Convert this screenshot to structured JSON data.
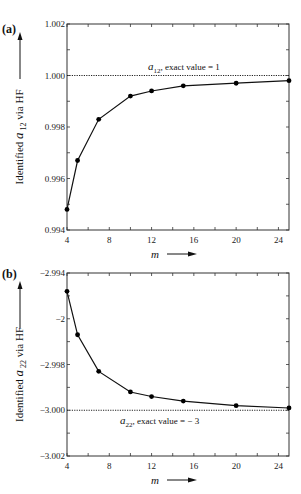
{
  "chart_data": [
    {
      "type": "line",
      "panel": "(a)",
      "title": "",
      "xlabel": "m",
      "ylabel": "Identified a12 via HF",
      "ylabel_main": "Identified ",
      "ylabel_sym": "a",
      "ylabel_sub": "12",
      "ylabel_tail": " via HF",
      "xlim": [
        4,
        25
      ],
      "ylim": [
        0.994,
        1.002
      ],
      "xticks": [
        4,
        8,
        12,
        16,
        20,
        24
      ],
      "yticks": [
        "0.994",
        "0.996",
        "0.998",
        "1.000",
        "1.002"
      ],
      "reference_line": {
        "value": 1.0,
        "style": "dotted"
      },
      "annotation": {
        "sym": "a",
        "sub": "12",
        "text": ", exact value = 1"
      },
      "x": [
        4,
        5,
        7,
        10,
        12,
        15,
        20,
        25
      ],
      "values": [
        0.9948,
        0.9967,
        0.9983,
        0.9992,
        0.9994,
        0.9996,
        0.9997,
        0.9998
      ],
      "grid": false
    },
    {
      "type": "line",
      "panel": "(b)",
      "title": "",
      "xlabel": "m",
      "ylabel": "Identified a22 via HF",
      "ylabel_main": "Identified ",
      "ylabel_sym": "a",
      "ylabel_sub": "22",
      "ylabel_tail": " via HF",
      "xlim": [
        4,
        25
      ],
      "ylim": [
        -3.002,
        -2.994
      ],
      "xticks": [
        4,
        8,
        12,
        16,
        20,
        24
      ],
      "yticks": [
        "-3.002",
        "-3.000",
        "-2.998",
        "-2",
        "-2.994"
      ],
      "reference_line": {
        "value": -3.0,
        "style": "dotted"
      },
      "annotation": {
        "sym": "a",
        "sub": "22",
        "text": ", exact value = − 3"
      },
      "x": [
        4,
        5,
        7,
        10,
        12,
        15,
        20,
        25
      ],
      "values": [
        -2.9948,
        -2.9967,
        -2.9983,
        -2.9992,
        -2.9994,
        -2.9996,
        -2.9998,
        -2.9999
      ],
      "grid": false
    }
  ],
  "labels": {
    "panel_a": "(a)",
    "panel_b": "(b)",
    "x_axis": "m",
    "ytick_display_a": [
      "0.994",
      "0.996",
      "0.998",
      "1.000",
      "1.002"
    ],
    "ytick_display_b": [
      "−3.002",
      "−3.000",
      "−2.998",
      "−2",
      "−2.994"
    ],
    "xtick_display": [
      "4",
      "8",
      "12",
      "16",
      "20",
      "24"
    ]
  },
  "colors": {
    "line": "#111111",
    "axis": "#333333",
    "marker": "#000000"
  }
}
